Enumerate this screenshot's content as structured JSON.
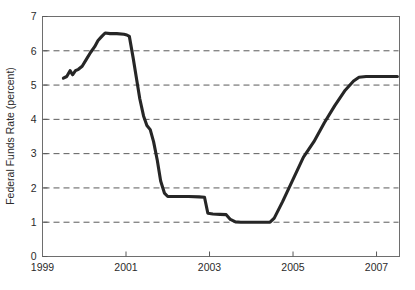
{
  "figure": {
    "background_color": "#ffffff",
    "frame_color": "#6e6e6e",
    "grid_color": "#5a5a5a",
    "line_color": "#262626"
  },
  "chart_data": {
    "type": "line",
    "title": "",
    "xlabel": "",
    "ylabel": "Federal Funds Rate (percent)",
    "xlim": [
      1999,
      2007.55
    ],
    "ylim": [
      0,
      7
    ],
    "grid": true,
    "grid_axis": "y",
    "grid_style": "dashed",
    "legend": "none",
    "xticks": [
      1999,
      2001,
      2003,
      2005,
      2007
    ],
    "xtick_labels": [
      "1999",
      "2001",
      "2003",
      "2005",
      "2007"
    ],
    "yticks": [
      0,
      1,
      2,
      3,
      4,
      5,
      6,
      7
    ],
    "ytick_labels": [
      "0",
      "1",
      "2",
      "3",
      "4",
      "5",
      "6",
      "7"
    ],
    "series": [
      {
        "name": "Federal Funds Rate",
        "color": "#262626",
        "x": [
          1999.5,
          1999.58,
          1999.66,
          1999.72,
          1999.79,
          1999.86,
          1999.95,
          2000.05,
          2000.15,
          2000.25,
          2000.33,
          2000.42,
          2000.5,
          2000.62,
          2000.78,
          2000.95,
          2001.02,
          2001.08,
          2001.17,
          2001.25,
          2001.33,
          2001.42,
          2001.5,
          2001.58,
          2001.66,
          2001.75,
          2001.83,
          2001.92,
          2002.0,
          2002.25,
          2002.5,
          2002.75,
          2002.88,
          2002.96,
          2003.08,
          2003.25,
          2003.4,
          2003.5,
          2003.62,
          2003.75,
          2004.0,
          2004.25,
          2004.45,
          2004.55,
          2004.75,
          2005.0,
          2005.25,
          2005.5,
          2005.75,
          2006.0,
          2006.25,
          2006.45,
          2006.58,
          2006.75,
          2007.0,
          2007.25,
          2007.5
        ],
        "y": [
          5.2,
          5.25,
          5.42,
          5.3,
          5.42,
          5.46,
          5.55,
          5.75,
          5.95,
          6.12,
          6.3,
          6.42,
          6.52,
          6.5,
          6.5,
          6.48,
          6.46,
          6.42,
          5.8,
          5.2,
          4.6,
          4.1,
          3.82,
          3.7,
          3.35,
          2.8,
          2.2,
          1.85,
          1.75,
          1.75,
          1.75,
          1.74,
          1.73,
          1.26,
          1.24,
          1.23,
          1.22,
          1.08,
          1.01,
          1.0,
          1.0,
          1.0,
          1.0,
          1.12,
          1.6,
          2.25,
          2.9,
          3.35,
          3.9,
          4.4,
          4.85,
          5.12,
          5.23,
          5.25,
          5.25,
          5.25,
          5.25
        ]
      }
    ]
  }
}
